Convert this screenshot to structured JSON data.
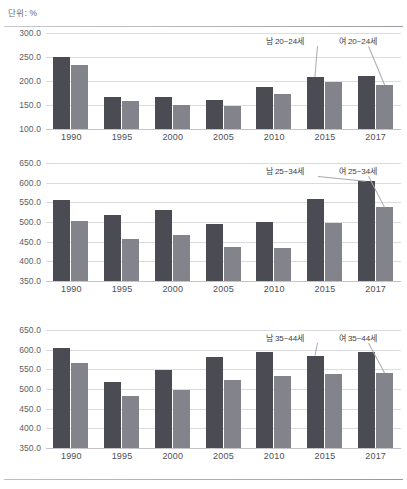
{
  "header": {
    "unit_label": "단위: %"
  },
  "series_colors": {
    "male": "#4b4b53",
    "female": "#83838b"
  },
  "chart_data": [
    {
      "id": "chart-20-24",
      "type": "bar",
      "title": "",
      "xlabel": "",
      "ylabel": "",
      "ylim": [
        100.0,
        300.0
      ],
      "yticks": [
        "300.0",
        "250.0",
        "200.0",
        "150.0",
        "100.0"
      ],
      "ytick_values": [
        300.0,
        250.0,
        200.0,
        150.0,
        100.0
      ],
      "grid": true,
      "categories": [
        "1990",
        "1995",
        "2000",
        "2005",
        "2010",
        "2015",
        "2017"
      ],
      "series": [
        {
          "name": "남 20~24세",
          "values": [
            250.0,
            166.0,
            167.0,
            161.0,
            188.0,
            209.0,
            210.0
          ]
        },
        {
          "name": "여 20~24세",
          "values": [
            234.0,
            158.0,
            149.0,
            147.0,
            172.0,
            197.0,
            192.0
          ]
        }
      ],
      "annotations": [
        {
          "text": "남 20~24세",
          "target_series": "남 20~24세",
          "target_category": "2015"
        },
        {
          "text": "여 20~24세",
          "target_series": "여 20~24세",
          "target_category": "2017"
        }
      ]
    },
    {
      "id": "chart-25-34",
      "type": "bar",
      "title": "",
      "xlabel": "",
      "ylabel": "",
      "ylim": [
        350.0,
        650.0
      ],
      "yticks": [
        "650.0",
        "600.0",
        "550.0",
        "500.0",
        "450.0",
        "400.0",
        "350.0"
      ],
      "ytick_values": [
        650.0,
        600.0,
        550.0,
        500.0,
        450.0,
        400.0,
        350.0
      ],
      "grid": true,
      "categories": [
        "1990",
        "1995",
        "2000",
        "2005",
        "2010",
        "2015",
        "2017"
      ],
      "series": [
        {
          "name": "남 25~34세",
          "values": [
            557.0,
            517.0,
            531.0,
            495.0,
            501.0,
            558.0,
            605.0
          ]
        },
        {
          "name": "여 25~34세",
          "values": [
            502.0,
            456.0,
            468.0,
            436.0,
            434.0,
            497.0,
            537.0
          ]
        }
      ],
      "annotations": [
        {
          "text": "남 25~34세",
          "target_series": "남 25~34세",
          "target_category": "2017"
        },
        {
          "text": "여 25~34세",
          "target_series": "여 25~34세",
          "target_category": "2017"
        }
      ]
    },
    {
      "id": "chart-35-44",
      "type": "bar",
      "title": "",
      "xlabel": "",
      "ylabel": "",
      "ylim": [
        350.0,
        650.0
      ],
      "yticks": [
        "650.0",
        "600.0",
        "550.0",
        "500.0",
        "450.0",
        "400.0",
        "350.0"
      ],
      "ytick_values": [
        650.0,
        600.0,
        550.0,
        500.0,
        450.0,
        400.0,
        350.0
      ],
      "grid": true,
      "categories": [
        "1990",
        "1995",
        "2000",
        "2005",
        "2010",
        "2015",
        "2017"
      ],
      "series": [
        {
          "name": "남 35~44세",
          "values": [
            605.0,
            518.0,
            548.0,
            582.0,
            594.0,
            584.0,
            593.0
          ]
        },
        {
          "name": "여 35~44세",
          "values": [
            565.0,
            482.0,
            498.0,
            523.0,
            533.0,
            537.0,
            541.0
          ]
        }
      ],
      "annotations": [
        {
          "text": "남 35~44세",
          "target_series": "남 35~44세",
          "target_category": "2015"
        },
        {
          "text": "여 35~44세",
          "target_series": "여 35~44세",
          "target_category": "2017"
        }
      ]
    }
  ]
}
